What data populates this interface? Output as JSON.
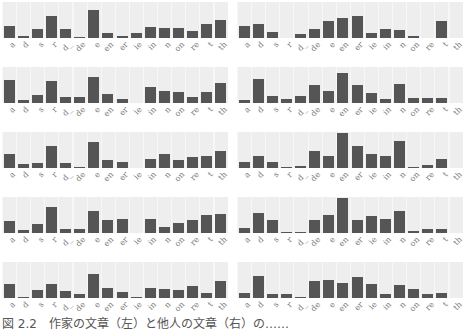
{
  "chart_data": [
    {
      "type": "bar",
      "panel": "row1-left",
      "categories": [
        "a",
        "d",
        "s",
        "r",
        "d_",
        "de",
        "e",
        "en",
        "er",
        "ie",
        "in",
        "n",
        "on",
        "re",
        "t",
        "th"
      ],
      "values": [
        0.32,
        0.06,
        0.24,
        0.62,
        0.24,
        0.03,
        0.78,
        0.13,
        0.06,
        0.13,
        0.3,
        0.27,
        0.27,
        0.2,
        0.38,
        0.5
      ],
      "ylim": [
        0,
        1
      ]
    },
    {
      "type": "bar",
      "panel": "row1-right",
      "categories": [
        "a",
        "d",
        "s",
        "r",
        "d_",
        "de",
        "e",
        "en",
        "er",
        "ie",
        "in",
        "n",
        "on",
        "re",
        "t",
        "th"
      ],
      "values": [
        0.34,
        0.38,
        0.18,
        0.0,
        0.1,
        0.26,
        0.46,
        0.55,
        0.6,
        0.14,
        0.25,
        0.21,
        0.06,
        0.0,
        0.46,
        0.0
      ],
      "ylim": [
        0,
        1
      ]
    },
    {
      "type": "bar",
      "panel": "row2-left",
      "categories": [
        "a",
        "d",
        "s",
        "r",
        "d_",
        "de",
        "e",
        "en",
        "er",
        "ie",
        "in",
        "n",
        "on",
        "re",
        "t",
        "th"
      ],
      "values": [
        0.64,
        0.07,
        0.22,
        0.6,
        0.16,
        0.16,
        0.72,
        0.25,
        0.12,
        0.0,
        0.44,
        0.34,
        0.3,
        0.17,
        0.3,
        0.56
      ],
      "ylim": [
        0,
        1
      ]
    },
    {
      "type": "bar",
      "panel": "row2-right",
      "categories": [
        "a",
        "d",
        "s",
        "r",
        "d_",
        "de",
        "e",
        "en",
        "er",
        "ie",
        "in",
        "n",
        "on",
        "re",
        "t",
        "th"
      ],
      "values": [
        0.09,
        0.66,
        0.2,
        0.12,
        0.19,
        0.5,
        0.34,
        0.84,
        0.5,
        0.28,
        0.11,
        0.54,
        0.14,
        0.14,
        0.14,
        0.0
      ],
      "ylim": [
        0,
        1
      ]
    },
    {
      "type": "bar",
      "panel": "row3-left",
      "categories": [
        "a",
        "d",
        "s",
        "r",
        "d_",
        "de",
        "e",
        "en",
        "er",
        "ie",
        "in",
        "n",
        "on",
        "re",
        "t",
        "th"
      ],
      "values": [
        0.38,
        0.1,
        0.14,
        0.62,
        0.14,
        0.04,
        0.73,
        0.22,
        0.18,
        0.0,
        0.26,
        0.38,
        0.22,
        0.3,
        0.34,
        0.48
      ],
      "ylim": [
        0,
        1
      ]
    },
    {
      "type": "bar",
      "panel": "row3-right",
      "categories": [
        "a",
        "d",
        "s",
        "r",
        "d_",
        "de",
        "e",
        "en",
        "er",
        "ie",
        "in",
        "n",
        "on",
        "re",
        "t",
        "th"
      ],
      "values": [
        0.16,
        0.34,
        0.16,
        0.04,
        0.06,
        0.46,
        0.33,
        0.98,
        0.62,
        0.38,
        0.32,
        0.74,
        0.03,
        0.08,
        0.25,
        0.0
      ],
      "ylim": [
        0,
        1
      ]
    },
    {
      "type": "bar",
      "panel": "row4-left",
      "categories": [
        "a",
        "d",
        "s",
        "r",
        "d_",
        "de",
        "e",
        "en",
        "er",
        "ie",
        "in",
        "n",
        "on",
        "re",
        "t",
        "th"
      ],
      "values": [
        0.32,
        0.08,
        0.24,
        0.72,
        0.11,
        0.11,
        0.6,
        0.36,
        0.4,
        0.0,
        0.38,
        0.18,
        0.27,
        0.35,
        0.5,
        0.54
      ],
      "ylim": [
        0,
        1
      ]
    },
    {
      "type": "bar",
      "panel": "row4-right",
      "categories": [
        "a",
        "d",
        "s",
        "r",
        "d_",
        "de",
        "e",
        "en",
        "er",
        "ie",
        "in",
        "n",
        "on",
        "re",
        "t",
        "th"
      ],
      "values": [
        0.14,
        0.55,
        0.36,
        0.03,
        0.03,
        0.36,
        0.5,
        0.96,
        0.36,
        0.46,
        0.38,
        0.61,
        0.06,
        0.12,
        0.12,
        0.0
      ],
      "ylim": [
        0,
        1
      ]
    },
    {
      "type": "bar",
      "panel": "row5-left",
      "categories": [
        "a",
        "d",
        "s",
        "r",
        "d_",
        "de",
        "e",
        "en",
        "er",
        "ie",
        "in",
        "n",
        "on",
        "re",
        "t",
        "th"
      ],
      "values": [
        0.4,
        0.02,
        0.22,
        0.4,
        0.2,
        0.1,
        0.66,
        0.28,
        0.16,
        0.02,
        0.27,
        0.25,
        0.22,
        0.32,
        0.15,
        0.46
      ],
      "ylim": [
        0,
        1
      ]
    },
    {
      "type": "bar",
      "panel": "row5-right",
      "categories": [
        "a",
        "d",
        "s",
        "r",
        "d_",
        "de",
        "e",
        "en",
        "er",
        "ie",
        "in",
        "n",
        "on",
        "re",
        "t",
        "th"
      ],
      "values": [
        0.14,
        0.61,
        0.1,
        0.1,
        0.03,
        0.46,
        0.49,
        0.43,
        0.59,
        0.4,
        0.12,
        0.35,
        0.25,
        0.11,
        0.15,
        0.0
      ],
      "ylim": [
        0,
        1
      ]
    }
  ],
  "caption": "図 2.2　作家の文章（左）と他人の文章（右）の……"
}
